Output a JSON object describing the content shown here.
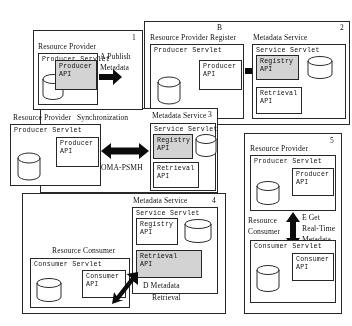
{
  "diagram": {
    "panels": [
      {
        "number": "1",
        "letter": "A",
        "action": "Publish",
        "action2": "Metadata",
        "actors": [
          {
            "name": "Resource Provider"
          }
        ],
        "servlet": "Producer Servlet",
        "apis": [
          {
            "line1": "Producer",
            "line2": "API",
            "shaded": true
          }
        ]
      },
      {
        "number": "2",
        "letter": "B",
        "action": "Resource Provider Register",
        "actors": [
          {
            "name": "Resource Provider Register"
          },
          {
            "name": "Metadata Service"
          }
        ],
        "servlet_left": "Producer Servlet",
        "servlet_right": "Service Servlet",
        "apis_left": [
          {
            "line1": "Producer",
            "line2": "API",
            "shaded": false
          }
        ],
        "apis_right": [
          {
            "line1": "Registry",
            "line2": "API",
            "shaded": true
          },
          {
            "line1": "Retrieval",
            "line2": "API",
            "shaded": false
          }
        ]
      },
      {
        "number": "3",
        "letter": "C",
        "action": "Synchronization",
        "protocol": "OMA-PSMH",
        "actors": [
          {
            "name": "Resource Provider"
          },
          {
            "name": "Metadata Service"
          }
        ],
        "servlet_left": "Producer Servlet",
        "servlet_right": "Service Servlet",
        "apis_left": [
          {
            "line1": "Producer",
            "line2": "API",
            "shaded": false
          }
        ],
        "apis_right": [
          {
            "line1": "Registry",
            "line2": "API",
            "shaded": true
          },
          {
            "line1": "Retrieval",
            "line2": "API",
            "shaded": false
          }
        ]
      },
      {
        "number": "4",
        "letter": "D",
        "action": "Metadata",
        "action2": "Retrieval",
        "actors": [
          {
            "name": "Resource Consumer"
          },
          {
            "name": "Metadata Service"
          }
        ],
        "servlet_left": "Consumer Servlet",
        "servlet_right": "Service Servlet",
        "apis_left": [
          {
            "line1": "Consumer",
            "line2": "API",
            "shaded": false
          }
        ],
        "apis_right": [
          {
            "line1": "Registry",
            "line2": "API",
            "shaded": false
          },
          {
            "line1": "Retrieval",
            "line2": "API",
            "shaded": true
          }
        ]
      },
      {
        "number": "5",
        "letter": "E",
        "action": "Get",
        "action2": "Real-Time",
        "action3": "Metadata",
        "actors": [
          {
            "name": "Resource Provider"
          },
          {
            "name": "Resource",
            "name2": "Consumer"
          }
        ],
        "servlet_top": "Producer Servlet",
        "servlet_bottom": "Consumer Servlet",
        "apis_top": [
          {
            "line1": "Producer",
            "line2": "API",
            "shaded": false
          }
        ],
        "apis_bottom": [
          {
            "line1": "Consumer",
            "line2": "API",
            "shaded": false
          }
        ]
      }
    ],
    "colors": {
      "stroke": "#2b2b2b",
      "shade": "#cfcfcf",
      "background": "#ffffff"
    }
  }
}
